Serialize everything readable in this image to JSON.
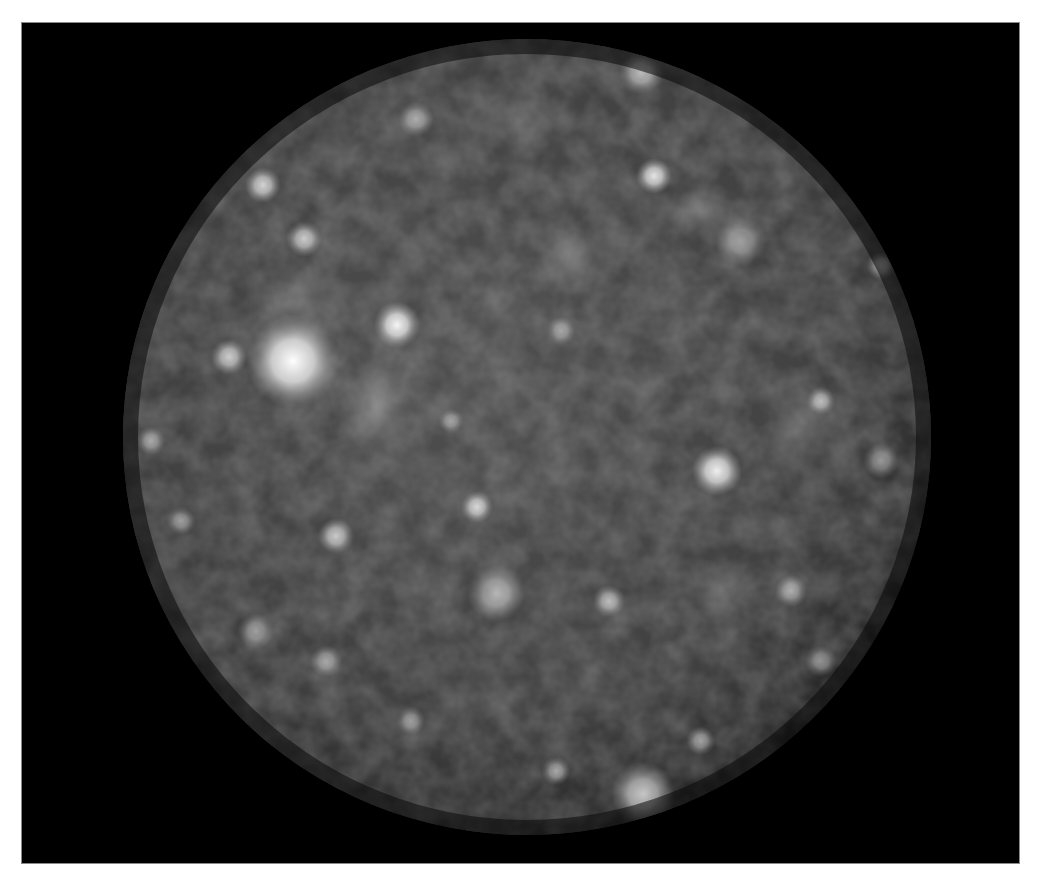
{
  "image": {
    "subject": "cratered moon photograph",
    "background_color": "#000000",
    "page_color": "#ffffff",
    "moon": {
      "center": [
        526,
        436
      ],
      "radius_x": 404,
      "radius_y": 398,
      "base_color": "#4a4a4a",
      "limb_color": "#1a1a1a"
    },
    "bright_spots": [
      {
        "x": 292,
        "y": 360,
        "r": 26,
        "o": 1.0
      },
      {
        "x": 396,
        "y": 324,
        "r": 13,
        "o": 0.95
      },
      {
        "x": 228,
        "y": 356,
        "r": 10,
        "o": 0.7
      },
      {
        "x": 716,
        "y": 470,
        "r": 14,
        "o": 0.9
      },
      {
        "x": 653,
        "y": 175,
        "r": 10,
        "o": 0.85
      },
      {
        "x": 640,
        "y": 72,
        "r": 12,
        "o": 0.6
      },
      {
        "x": 262,
        "y": 184,
        "r": 10,
        "o": 0.75
      },
      {
        "x": 303,
        "y": 238,
        "r": 10,
        "o": 0.7
      },
      {
        "x": 476,
        "y": 506,
        "r": 9,
        "o": 0.75
      },
      {
        "x": 335,
        "y": 535,
        "r": 10,
        "o": 0.7
      },
      {
        "x": 820,
        "y": 400,
        "r": 8,
        "o": 0.6
      },
      {
        "x": 642,
        "y": 793,
        "r": 18,
        "o": 0.7
      },
      {
        "x": 555,
        "y": 770,
        "r": 8,
        "o": 0.55
      },
      {
        "x": 608,
        "y": 600,
        "r": 9,
        "o": 0.6
      },
      {
        "x": 495,
        "y": 592,
        "r": 16,
        "o": 0.55
      },
      {
        "x": 415,
        "y": 118,
        "r": 10,
        "o": 0.55
      },
      {
        "x": 880,
        "y": 265,
        "r": 8,
        "o": 0.5
      },
      {
        "x": 150,
        "y": 440,
        "r": 8,
        "o": 0.5
      },
      {
        "x": 740,
        "y": 240,
        "r": 14,
        "o": 0.45
      },
      {
        "x": 255,
        "y": 630,
        "r": 10,
        "o": 0.45
      },
      {
        "x": 325,
        "y": 660,
        "r": 9,
        "o": 0.5
      },
      {
        "x": 700,
        "y": 740,
        "r": 8,
        "o": 0.5
      },
      {
        "x": 790,
        "y": 590,
        "r": 9,
        "o": 0.5
      },
      {
        "x": 880,
        "y": 460,
        "r": 10,
        "o": 0.45
      },
      {
        "x": 180,
        "y": 520,
        "r": 8,
        "o": 0.45
      },
      {
        "x": 560,
        "y": 330,
        "r": 8,
        "o": 0.45
      },
      {
        "x": 450,
        "y": 420,
        "r": 7,
        "o": 0.45
      },
      {
        "x": 820,
        "y": 660,
        "r": 9,
        "o": 0.45
      },
      {
        "x": 410,
        "y": 720,
        "r": 8,
        "o": 0.45
      }
    ],
    "bright_patches": [
      {
        "x": 375,
        "y": 405,
        "rx": 45,
        "ry": 60,
        "o": 0.45
      },
      {
        "x": 568,
        "y": 255,
        "rx": 35,
        "ry": 40,
        "o": 0.35
      },
      {
        "x": 800,
        "y": 420,
        "rx": 40,
        "ry": 50,
        "o": 0.3
      },
      {
        "x": 720,
        "y": 590,
        "rx": 40,
        "ry": 35,
        "o": 0.3
      },
      {
        "x": 700,
        "y": 210,
        "rx": 45,
        "ry": 30,
        "o": 0.3
      },
      {
        "x": 300,
        "y": 300,
        "rx": 60,
        "ry": 50,
        "o": 0.25
      },
      {
        "x": 520,
        "y": 120,
        "rx": 60,
        "ry": 30,
        "o": 0.25
      }
    ]
  }
}
